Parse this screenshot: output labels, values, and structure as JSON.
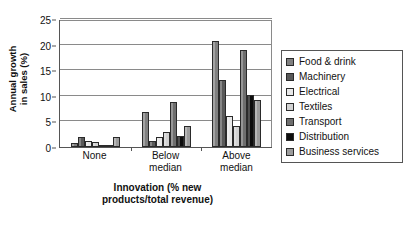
{
  "chart_data": {
    "type": "bar",
    "title": "",
    "subtitle": "",
    "xlabel_lines": [
      "Innovation (% new",
      "products/total revenue)"
    ],
    "ylabel_lines": [
      "Annual growth",
      "in sales (%)"
    ],
    "categories": [
      "None",
      "Below median",
      "Above median"
    ],
    "category_label_lines": [
      [
        "None"
      ],
      [
        "Below",
        "median"
      ],
      [
        "Above",
        "median"
      ]
    ],
    "ylim": [
      0,
      25
    ],
    "ytick_values": [
      0,
      5,
      10,
      15,
      20,
      25
    ],
    "ytick_labels": [
      "0",
      "5",
      "10",
      "15",
      "20",
      "25"
    ],
    "grid": true,
    "grid_axis": "y",
    "legend_position": "right",
    "series": [
      {
        "name": "Food & drink",
        "color": "#808080",
        "values": [
          0.8,
          6.8,
          20.8
        ]
      },
      {
        "name": "Machinery",
        "color": "#595959",
        "values": [
          2.0,
          1.1,
          13.1
        ]
      },
      {
        "name": "Electrical",
        "color": "#e8e8e8",
        "values": [
          1.1,
          1.9,
          6.1
        ]
      },
      {
        "name": "Textiles",
        "color": "#d2d2d2",
        "values": [
          0.9,
          3.0,
          4.1
        ]
      },
      {
        "name": "Transport",
        "color": "#6e6e6e",
        "values": [
          0.3,
          8.8,
          18.9
        ]
      },
      {
        "name": "Distribution",
        "color": "#0d0d0d",
        "values": [
          0.0,
          2.2,
          10.2
        ]
      },
      {
        "name": "Business services",
        "color": "#9c9c9c",
        "values": [
          1.9,
          4.1,
          9.1
        ]
      }
    ]
  },
  "legend": {
    "items": [
      {
        "label": "Food & drink"
      },
      {
        "label": "Machinery"
      },
      {
        "label": "Electrical"
      },
      {
        "label": "Textiles"
      },
      {
        "label": "Transport"
      },
      {
        "label": "Distribution"
      },
      {
        "label": "Business services"
      }
    ]
  }
}
